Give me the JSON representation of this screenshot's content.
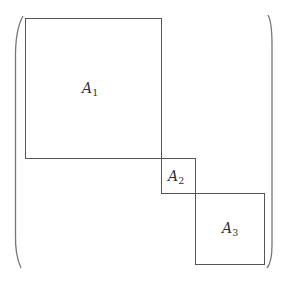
{
  "diagram": {
    "type": "block-diagonal-matrix",
    "line_color": "#555555",
    "paren_color": "#777777",
    "blocks": [
      {
        "label": "A",
        "subscript": "1",
        "x": 25,
        "y": 18,
        "w": 136,
        "h": 140,
        "label_x": 82,
        "label_y": 93
      },
      {
        "label": "A",
        "subscript": "2",
        "x": 161,
        "y": 158,
        "w": 34,
        "h": 35,
        "label_x": 168,
        "label_y": 181
      },
      {
        "label": "A",
        "subscript": "3",
        "x": 195,
        "y": 193,
        "w": 69,
        "h": 71,
        "label_x": 222,
        "label_y": 233
      }
    ]
  }
}
